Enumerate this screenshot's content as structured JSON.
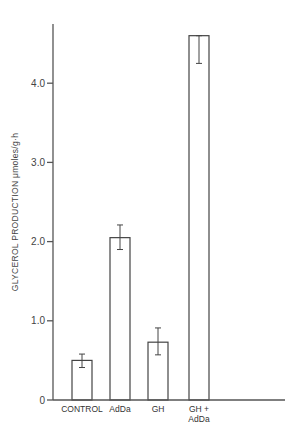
{
  "chart_data": {
    "type": "bar",
    "title": "",
    "xlabel": "",
    "ylabel": "GLYCEROL PRODUCTION  μmoles/g·h",
    "ylim": [
      0,
      4.8
    ],
    "yticks": [
      0,
      1.0,
      2.0,
      3.0,
      4.0
    ],
    "ytick_labels": [
      "0",
      "1.0",
      "2.0",
      "3.0",
      "4.0"
    ],
    "grid": false,
    "legend": null,
    "categories": [
      "CONTROL",
      "AdDa",
      "GH",
      "GH + AdDa"
    ],
    "category_lines": [
      [
        "CONTROL"
      ],
      [
        "AdDa"
      ],
      [
        "GH"
      ],
      [
        "GH +",
        "AdDa"
      ]
    ],
    "values": [
      0.5,
      2.05,
      0.73,
      4.6
    ],
    "error_low": [
      0.41,
      1.9,
      0.57,
      4.25
    ],
    "error_high": [
      0.58,
      2.21,
      0.91,
      4.6
    ],
    "bar_fill": "#ffffff",
    "bar_stroke": "#444444"
  }
}
